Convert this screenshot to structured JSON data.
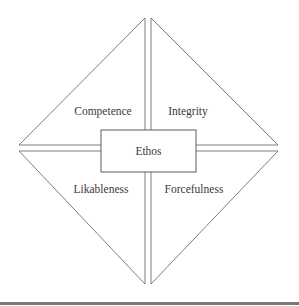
{
  "diagram": {
    "center": {
      "label": "Ethos"
    },
    "quadrants": [
      {
        "position": "top-left",
        "label": "Competence"
      },
      {
        "position": "top-right",
        "label": "Integrity"
      },
      {
        "position": "bottom-left",
        "label": "Likableness"
      },
      {
        "position": "bottom-right",
        "label": "Forcefulness"
      }
    ]
  },
  "colors": {
    "stroke": "#6f6f6f",
    "text": "#3a3a3a",
    "rule": "#7a7a7a"
  }
}
